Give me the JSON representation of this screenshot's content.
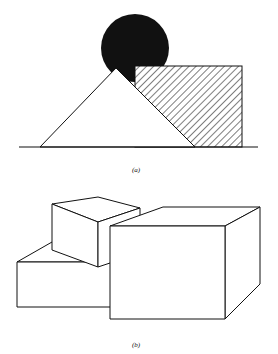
{
  "figure_a": {
    "label": "(a)",
    "elements": [
      "black-circle",
      "white-triangle",
      "hatched-rectangle",
      "ground-line"
    ],
    "colors": {
      "stroke": "#111111",
      "fill_dark": "#111111",
      "background": "#ffffff"
    }
  },
  "figure_b": {
    "label": "(b)",
    "elements": [
      "small-cube",
      "low-box",
      "large-box"
    ],
    "colors": {
      "stroke": "#111111",
      "background": "#ffffff"
    }
  }
}
